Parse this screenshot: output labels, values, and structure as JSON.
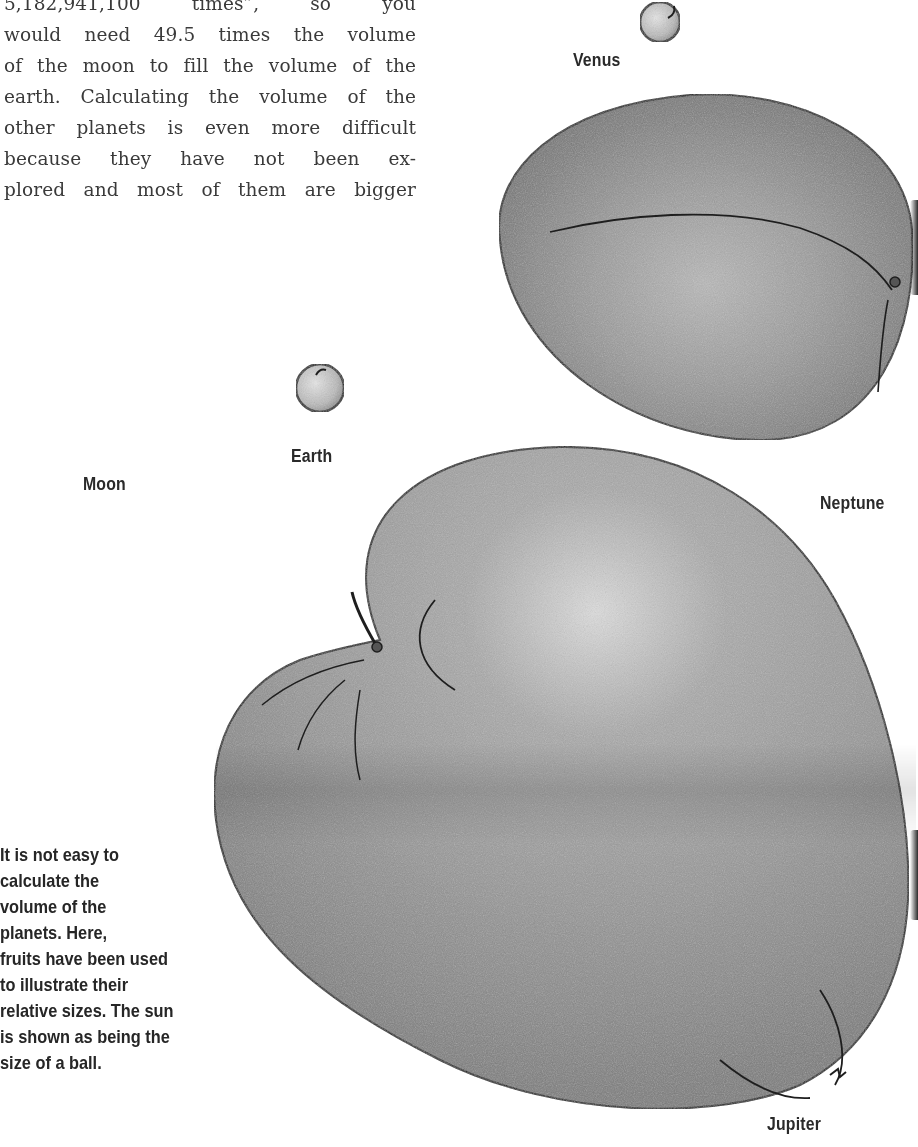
{
  "page": {
    "type": "scanned-book-page",
    "background": "#ffffff"
  },
  "body_text": {
    "lines": [
      "5,182,941,100 times”, so you",
      "would need 49.5 times the volume",
      "of the moon to fill the volume of the",
      "earth. Calculating the volume of the",
      "other planets is even more difficult",
      "because they have not been ex-",
      "plored and most of them are bigger"
    ]
  },
  "caption": {
    "lines": [
      "It is not easy to",
      "calculate the",
      "volume of the",
      "planets. Here,",
      "fruits have been used",
      "to illustrate their",
      "relative sizes. The sun",
      "is shown as being the",
      "size of a ball."
    ]
  },
  "labels": {
    "venus": "Venus",
    "earth": "Earth",
    "moon": "Moon",
    "neptune": "Neptune",
    "jupiter": "Jupiter"
  },
  "illustrations": {
    "venus_fruit": "small round fruit (cherry/pea) drawn in pencil",
    "earth_fruit": "small round fruit (pea) drawn in pencil",
    "neptune_fruit": "large oval fruit (plum) drawn in pencil",
    "jupiter_fruit": "very large fruit (melon/apple) drawn in pencil"
  },
  "colors": {
    "text": "#3a3a3a",
    "label": "#2a2a2a",
    "fruit_fill_light": "#c8c8c8",
    "fruit_fill_mid": "#9a9a9a",
    "fruit_fill_dark": "#6f6f6f",
    "outline": "#1e1e1e"
  }
}
